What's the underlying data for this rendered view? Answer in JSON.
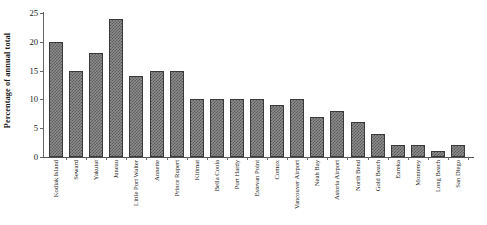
{
  "chart_data": {
    "type": "bar",
    "title": "",
    "xlabel": "",
    "ylabel": "Percentage of annual total",
    "ylim": [
      0,
      25
    ],
    "yticks": [
      0,
      5,
      10,
      15,
      20,
      25
    ],
    "ytick_labels": [
      "0",
      "5",
      "10",
      "15",
      "20",
      "25"
    ],
    "grid": false,
    "legend": null,
    "bar_fill": "#8c8c8c",
    "bar_pattern": "checkerboard",
    "bar_edge_color": "#3a3a3a",
    "categories": [
      "Kodiak Island",
      "Seward",
      "Yakutat",
      "Juneau",
      "Little Port Walter",
      "Annette",
      "Prince Rupert",
      "Kitimat",
      "Bella Coola",
      "Port Hardy",
      "Estevan Point",
      "Comox",
      "Vancouver Airport",
      "Neah Bay",
      "Astoria Airport",
      "North Bend",
      "Gold Beach",
      "Eureka",
      "Monterey",
      "Long Beach",
      "San Diego"
    ],
    "values": [
      20,
      15,
      18,
      24,
      14,
      15,
      15,
      10,
      10,
      10,
      10,
      9,
      10,
      7,
      8,
      6,
      4,
      2,
      2,
      1,
      2
    ]
  }
}
